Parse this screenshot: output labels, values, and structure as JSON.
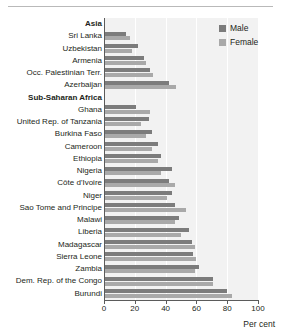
{
  "chart_data": {
    "type": "bar",
    "orientation": "horizontal",
    "title": "",
    "xlabel": "Per cent",
    "ylabel": "",
    "xlim": [
      0,
      100
    ],
    "xticks": [
      0,
      20,
      40,
      60,
      80,
      100
    ],
    "grid": true,
    "legend_position": "top-right",
    "categories": [
      "Asia",
      "Sri Lanka",
      "Uzbekistan",
      "Armenia",
      "Occ. Palestinian Terr.",
      "Azerbaijan",
      "Sub-Saharan Africa",
      "Ghana",
      "United Rep. of Tanzania",
      "Burkina Faso",
      "Cameroon",
      "Ethiopia",
      "Nigeria",
      "Côte d'Ivoire",
      "Niger",
      "Sao Tome and Principe",
      "Malawi",
      "Liberia",
      "Madagascar",
      "Sierra Leone",
      "Zambia",
      "Dem. Rep. of the Congo",
      "Burundi"
    ],
    "group_headers": [
      "Asia",
      "Sub-Saharan Africa"
    ],
    "series": [
      {
        "name": "Male",
        "color": "#7c7c7c",
        "values": [
          null,
          14,
          22,
          26,
          30,
          42,
          null,
          21,
          29,
          31,
          35,
          37,
          44,
          42,
          44,
          46,
          49,
          55,
          57,
          58,
          62,
          71,
          80
        ]
      },
      {
        "name": "Female",
        "color": "#a9a9a9",
        "values": [
          null,
          17,
          18,
          27,
          32,
          47,
          null,
          30,
          24,
          27,
          31,
          35,
          37,
          46,
          41,
          53,
          46,
          50,
          59,
          60,
          59,
          71,
          83
        ]
      }
    ]
  },
  "legend": {
    "items": [
      {
        "label": "Male",
        "color": "#7c7c7c"
      },
      {
        "label": "Female",
        "color": "#a9a9a9"
      }
    ]
  },
  "axis": {
    "x_title": "Per cent",
    "tick_labels": [
      "0",
      "20",
      "40",
      "60",
      "80",
      "100"
    ]
  }
}
